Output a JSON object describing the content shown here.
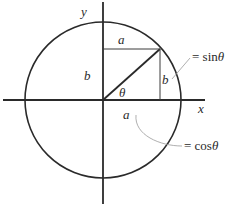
{
  "diagram": {
    "axes": {
      "x_label": "x",
      "y_label": "y"
    },
    "labels": {
      "top_a": "a",
      "left_b": "b",
      "right_b": "b",
      "bottom_a": "a",
      "angle": "θ"
    },
    "annotations": {
      "sin": {
        "prefix": "= sin",
        "symbol": "θ"
      },
      "cos": {
        "prefix": "= cos",
        "symbol": "θ"
      }
    },
    "colors": {
      "stroke": "#2a2a2a",
      "leader": "#9a9a9a"
    }
  }
}
